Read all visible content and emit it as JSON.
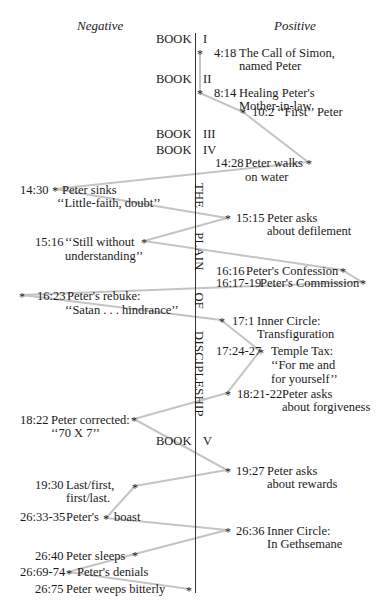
{
  "headers": {
    "negative": "Negative",
    "positive": "Positive"
  },
  "books": [
    {
      "label": "BOOK",
      "numeral": "I"
    },
    {
      "label": "BOOK",
      "numeral": "II"
    },
    {
      "label": "BOOK",
      "numeral": "III"
    },
    {
      "label": "BOOK",
      "numeral": "IV"
    },
    {
      "label": "BOOK",
      "numeral": "V"
    }
  ],
  "axis_label": {
    "words": [
      "THE",
      "PLAIN",
      "OF",
      "DISCIPLESHIP"
    ]
  },
  "positive": [
    {
      "ref": "4:18",
      "line1": "The Call of Simon,",
      "line2": "named Peter"
    },
    {
      "ref": "8:14",
      "line1": "Healing Peter's",
      "line2": "Mother-in-law"
    },
    {
      "ref": "10:2",
      "line1": "‘‘First’’ Peter"
    },
    {
      "ref": "14:28",
      "line1": "Peter walks",
      "line2": "on water"
    },
    {
      "ref": "15:15",
      "line1": "Peter asks",
      "line2": "about defilement"
    },
    {
      "ref": "16:16",
      "line1": "Peter's Confession"
    },
    {
      "ref": "16:17-19",
      "line1": "Peter's Commission"
    },
    {
      "ref": "17:1",
      "line1": "Inner Circle:",
      "line2": "Transfiguration"
    },
    {
      "ref": "17:24-27",
      "line1": "Temple Tax:",
      "line2": "‘‘For me and",
      "line3": "for yourself’’"
    },
    {
      "ref": "18:21-22",
      "line1": "Peter asks",
      "line2": "about forgiveness"
    },
    {
      "ref": "19:27",
      "line1": "Peter asks",
      "line2": "about rewards"
    },
    {
      "ref": "26:36",
      "line1": "Inner Circle:",
      "line2": "In Gethsemane"
    }
  ],
  "negative": [
    {
      "ref": "14:30",
      "line1": "Peter sinks",
      "line2": "‘‘Little-faith, doubt’’"
    },
    {
      "ref": "15:16",
      "line1": "‘‘Still without",
      "line2": "understanding’’"
    },
    {
      "ref": "16:23",
      "line1": "Peter's rebuke:",
      "line2": "‘‘Satan . . . hindrance’’"
    },
    {
      "ref": "18:22",
      "line1": "Peter corrected:",
      "line2": "‘‘70 X 7’’"
    },
    {
      "ref": "19:30",
      "line1": "Last/first,",
      "line2": "first/last."
    },
    {
      "ref": "26:33-35",
      "line1": "Peter's",
      "line2": "boast"
    },
    {
      "ref": "26:40",
      "line1": "Peter sleeps"
    },
    {
      "ref": "26:69-74",
      "line1": "Peter's denials"
    },
    {
      "ref": "26:75",
      "line1": "Peter weeps bitterly"
    }
  ],
  "star_glyph": "*",
  "colors": {
    "connector": "#c4c4c4",
    "axis": "#333333",
    "text": "#1a1a1a"
  },
  "path_points": [
    [
      200,
      53
    ],
    [
      200,
      93
    ],
    [
      243,
      112
    ],
    [
      308,
      162
    ],
    [
      55,
      189
    ],
    [
      227,
      218
    ],
    [
      144,
      241
    ],
    [
      342,
      270
    ],
    [
      362,
      282
    ],
    [
      22,
      295
    ],
    [
      221,
      320
    ],
    [
      260,
      351
    ],
    [
      227,
      393
    ],
    [
      134,
      419
    ],
    [
      227,
      470
    ],
    [
      135,
      486
    ],
    [
      106,
      518
    ],
    [
      227,
      530
    ],
    [
      135,
      554
    ],
    [
      68,
      572
    ],
    [
      189,
      589
    ]
  ]
}
